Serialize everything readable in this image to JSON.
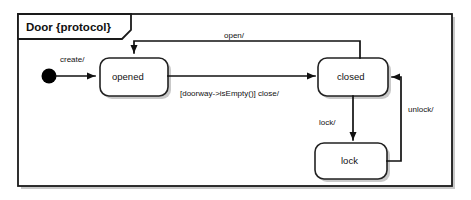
{
  "diagram": {
    "type": "uml-state-machine",
    "frame_title": "Door {protocol}",
    "states": [
      {
        "id": "opened",
        "label": "opened"
      },
      {
        "id": "closed",
        "label": "closed"
      },
      {
        "id": "lock",
        "label": "lock"
      }
    ],
    "initial_state": "opened",
    "transitions": [
      {
        "id": "create",
        "from": "initial",
        "to": "opened",
        "label": "create/"
      },
      {
        "id": "close",
        "from": "opened",
        "to": "closed",
        "label": "[doorway->isEmpty()] close/"
      },
      {
        "id": "open",
        "from": "closed",
        "to": "opened",
        "label": "open/"
      },
      {
        "id": "lock",
        "from": "closed",
        "to": "lock",
        "label": "lock/"
      },
      {
        "id": "unlock",
        "from": "lock",
        "to": "closed",
        "label": "unlock/"
      }
    ],
    "colors": {
      "background": "#ffffff",
      "stroke": "#111111",
      "state_fill": "#ffffff",
      "shadow": "#c9c9c9",
      "text": "#111111"
    }
  }
}
